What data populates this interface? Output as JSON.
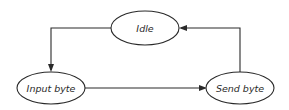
{
  "diagram": {
    "type": "state-transition",
    "states": [
      {
        "id": "idle",
        "label": "Idle",
        "cx": 145,
        "cy": 28,
        "rx": 34,
        "ry": 17
      },
      {
        "id": "input_byte",
        "label": "Input byte",
        "cx": 51,
        "cy": 88,
        "rx": 34,
        "ry": 16
      },
      {
        "id": "send_byte",
        "label": "Send byte",
        "cx": 240,
        "cy": 88,
        "rx": 34,
        "ry": 16
      }
    ],
    "transitions": [
      {
        "from": "idle",
        "to": "input_byte",
        "route": "left then down"
      },
      {
        "from": "input_byte",
        "to": "send_byte",
        "route": "straight right"
      },
      {
        "from": "send_byte",
        "to": "idle",
        "route": "up then left"
      }
    ],
    "colors": {
      "stroke": "#2a2a2a",
      "background": "#ffffff"
    }
  }
}
